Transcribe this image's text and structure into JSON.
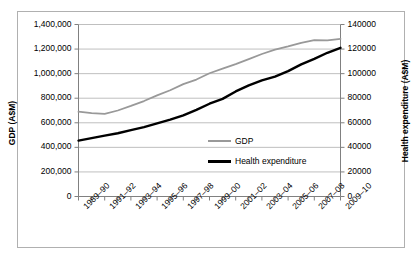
{
  "chart_data": {
    "type": "line",
    "title": "",
    "xlabel": "",
    "categories": [
      "1989-90",
      "1990-91",
      "1991-92",
      "1992-93",
      "1993-94",
      "1994-95",
      "1995-96",
      "1996-97",
      "1997-98",
      "1998-99",
      "1999-00",
      "2000-01",
      "2001-02",
      "2002-03",
      "2003-04",
      "2004-05",
      "2005-06",
      "2006-07",
      "2007-08",
      "2008-09",
      "2009-10"
    ],
    "xtick_labels": [
      "1989–90",
      "1991–92",
      "1993–94",
      "1995–96",
      "1997–98",
      "1999–00",
      "2001–02",
      "2003–04",
      "2005–06",
      "2007–08",
      "2009–10"
    ],
    "grid": true,
    "legend_position": "center-right",
    "axes": {
      "left": {
        "label": "GDP (A$M)",
        "ylim": [
          0,
          1400000
        ],
        "tick_step": 200000,
        "ticks": [
          0,
          200000,
          400000,
          600000,
          800000,
          1000000,
          1200000,
          1400000
        ],
        "tick_labels": [
          "0",
          "200,000",
          "400,000",
          "600,000",
          "800,000",
          "1,000,000",
          "1,200,000",
          "1,400,000"
        ]
      },
      "right": {
        "label": "Health expenditure (A$M)",
        "ylim": [
          0,
          140000
        ],
        "tick_step": 20000,
        "ticks": [
          0,
          20000,
          40000,
          60000,
          80000,
          100000,
          120000,
          140000
        ],
        "tick_labels": [
          "0",
          "20000",
          "40000",
          "60000",
          "80000",
          "100000",
          "120000",
          "140000"
        ]
      }
    },
    "series": [
      {
        "name": "GDP",
        "axis": "left",
        "color": "#999999",
        "line_width": 1.8,
        "values": [
          690000,
          678000,
          672000,
          700000,
          737000,
          777000,
          823000,
          865000,
          915000,
          952000,
          1003000,
          1041000,
          1078000,
          1118000,
          1160000,
          1196000,
          1222000,
          1251000,
          1272000,
          1271000,
          1283000
        ]
      },
      {
        "name": "Health expenditure",
        "axis": "right",
        "color": "#000000",
        "line_width": 2.4,
        "values": [
          45500,
          47500,
          49500,
          51500,
          54000,
          56500,
          59500,
          62500,
          66000,
          70500,
          75500,
          79500,
          85500,
          90500,
          94500,
          97500,
          102000,
          107500,
          112000,
          117000,
          121000
        ]
      }
    ]
  },
  "legend": {
    "items": [
      {
        "label": "GDP",
        "color": "#999999"
      },
      {
        "label": "Health expenditure",
        "color": "#000000"
      }
    ]
  }
}
